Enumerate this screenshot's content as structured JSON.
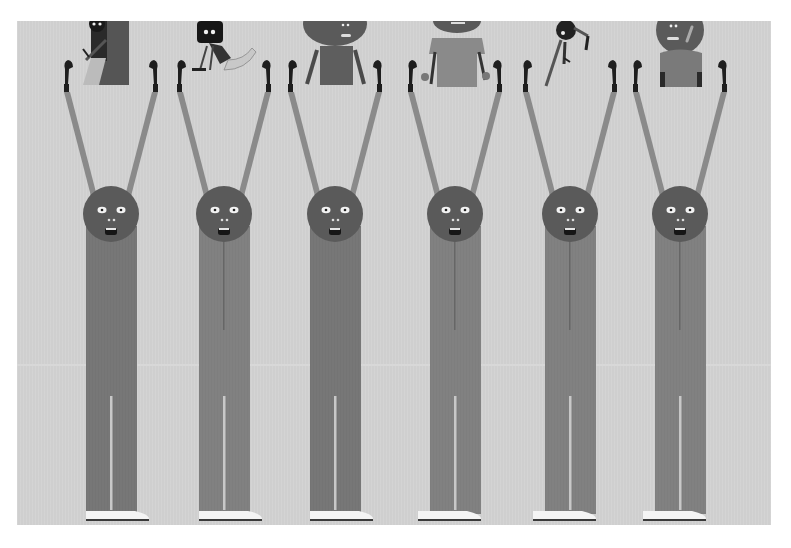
{
  "image": {
    "description": "Grayscale illustration of six identical tall figures with round heads, arms raised holding upward, long striped trousers and white sneakers; small cartoon characters peek above the top edge between each pair of hands",
    "background_color": "#cfcfcf",
    "page_color": "#ffffff"
  },
  "colors": {
    "head": "#5a5a5a",
    "body": "#747474",
    "body_alt": "#7e7e7e",
    "arm": "#8a8a8a",
    "hand": "#1e1e1e",
    "eye_white": "#f2f2f2",
    "mouth": "#161616",
    "shoe": "#f4f4f4",
    "shoe_sole": "#3a3a3a",
    "leg_gap": "#c8c8c8"
  },
  "figures": [
    {
      "id": 1,
      "cx": 111,
      "top_item": "dark-figure-with-tray"
    },
    {
      "id": 2,
      "cx": 224,
      "top_item": "robot-with-striped-tail"
    },
    {
      "id": 3,
      "cx": 335,
      "top_item": "round-head-figure-body"
    },
    {
      "id": 4,
      "cx": 455,
      "top_item": "tshirt-figure-holding-small-heads"
    },
    {
      "id": 5,
      "cx": 570,
      "top_item": "falling-small-figure"
    },
    {
      "id": 6,
      "cx": 680,
      "top_item": "round-head-figure-with-suspenders"
    }
  ]
}
